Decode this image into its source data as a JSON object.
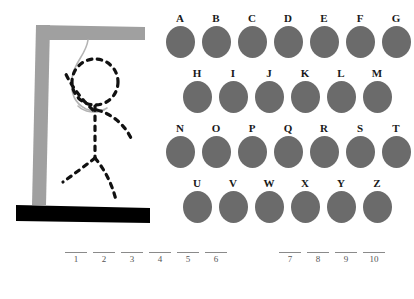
{
  "puzzle": {
    "title": "Hangman",
    "colors": {
      "gallows": "#a0a0a0",
      "base": "#000000",
      "rope": "#b0b0b0",
      "figure": "#111111",
      "letter_circle": "#6b6b6b",
      "blank_line": "#8a8a8a",
      "background": "#ffffff"
    }
  },
  "gallows": {
    "post_name": "gallows-post",
    "beam_name": "gallows-beam",
    "base_name": "gallows-base",
    "rope_name": "rope"
  },
  "figure": {
    "parts": [
      "head",
      "body",
      "left-arm",
      "right-arm",
      "left-leg",
      "right-leg"
    ],
    "style": "dashed"
  },
  "letters": {
    "rows": [
      {
        "indented": false,
        "items": [
          "A",
          "B",
          "C",
          "D",
          "E",
          "F",
          "G"
        ]
      },
      {
        "indented": true,
        "items": [
          "H",
          "I",
          "J",
          "K",
          "L",
          "M"
        ]
      },
      {
        "indented": false,
        "items": [
          "N",
          "O",
          "P",
          "Q",
          "R",
          "S",
          "T"
        ]
      },
      {
        "indented": true,
        "items": [
          "U",
          "V",
          "W",
          "X",
          "Y",
          "Z"
        ]
      }
    ]
  },
  "answer": {
    "groups": [
      {
        "numbers": [
          "1",
          "2",
          "3",
          "4",
          "5",
          "6"
        ]
      },
      {
        "numbers": [
          "7",
          "8",
          "9",
          "10"
        ]
      }
    ],
    "total_blanks": 10
  }
}
